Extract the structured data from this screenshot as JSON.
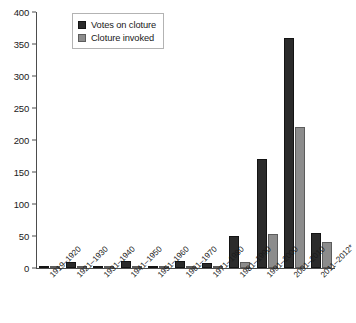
{
  "chart_data": {
    "type": "bar",
    "title": "",
    "subtitle": "",
    "xlabel": "",
    "ylabel": "",
    "ylim": [
      0,
      400
    ],
    "yticks": [
      0,
      50,
      100,
      150,
      200,
      250,
      300,
      350,
      400
    ],
    "grid": false,
    "legend_position": "top-left",
    "categories": [
      "1919–1920",
      "1921–1930",
      "1931–1940",
      "1941–1950",
      "1951–1960",
      "1961–1970",
      "1971–1980",
      "1981–1990",
      "1991–2000",
      "2001–2010",
      "2011–2012*"
    ],
    "series": [
      {
        "name": "Votes on cloture",
        "color": "#2b2b2b",
        "values": [
          1,
          10,
          2,
          11,
          2,
          11,
          8,
          50,
          170,
          360,
          55
        ]
      },
      {
        "name": "Cloture invoked",
        "color": "#8c8c8c",
        "values": [
          0,
          1,
          0,
          1,
          0,
          2,
          1,
          10,
          53,
          220,
          40
        ]
      }
    ],
    "footnote": "*"
  },
  "legend": {
    "items": [
      {
        "label": "Votes on cloture",
        "swatch": "votes"
      },
      {
        "label": "Cloture invoked",
        "swatch": "invoked"
      }
    ]
  },
  "axes": {
    "y_tick_labels": [
      "400",
      "350",
      "300",
      "250",
      "200",
      "150",
      "100",
      "50",
      "0"
    ]
  }
}
